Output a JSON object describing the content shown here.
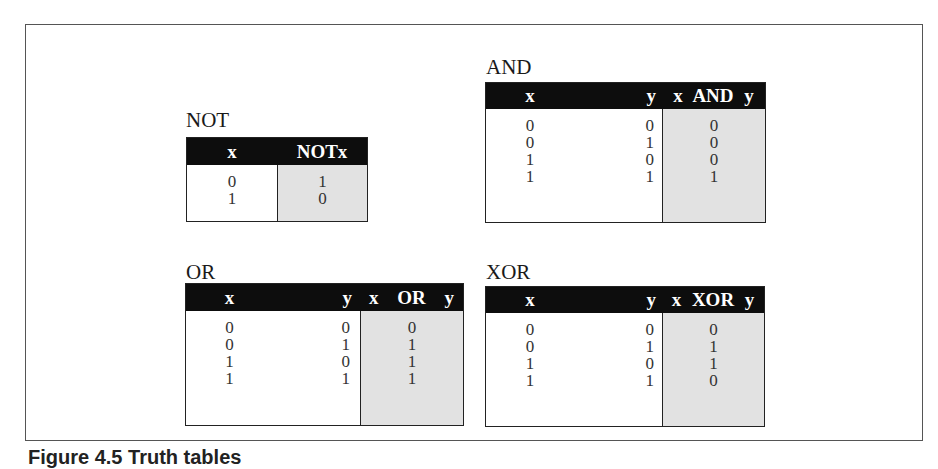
{
  "figure": {
    "caption_partial": "Figure 4.5 Truth tables",
    "colors": {
      "header_bg": "#0d0d0d",
      "header_text": "#ffffff",
      "result_fill": "#e2e2e2",
      "border": "#222222"
    }
  },
  "gates": {
    "not": {
      "label": "NOT",
      "headers": [
        "x",
        "NOTx"
      ],
      "rows": [
        {
          "x": "0",
          "out": "1"
        },
        {
          "x": "1",
          "out": "0"
        }
      ]
    },
    "and": {
      "label": "AND",
      "headers": [
        "x",
        "y",
        "x AND y"
      ],
      "rows": [
        {
          "x": "0",
          "y": "0",
          "out": "0"
        },
        {
          "x": "0",
          "y": "1",
          "out": "0"
        },
        {
          "x": "1",
          "y": "0",
          "out": "0"
        },
        {
          "x": "1",
          "y": "1",
          "out": "1"
        }
      ]
    },
    "or": {
      "label": "OR",
      "headers": [
        "x",
        "y",
        "x OR y"
      ],
      "rows": [
        {
          "x": "0",
          "y": "0",
          "out": "0"
        },
        {
          "x": "0",
          "y": "1",
          "out": "1"
        },
        {
          "x": "1",
          "y": "0",
          "out": "1"
        },
        {
          "x": "1",
          "y": "1",
          "out": "1"
        }
      ]
    },
    "xor": {
      "label": "XOR",
      "headers": [
        "x",
        "y",
        "x XOR y"
      ],
      "rows": [
        {
          "x": "0",
          "y": "0",
          "out": "0"
        },
        {
          "x": "0",
          "y": "1",
          "out": "1"
        },
        {
          "x": "1",
          "y": "0",
          "out": "1"
        },
        {
          "x": "1",
          "y": "1",
          "out": "0"
        }
      ]
    }
  }
}
